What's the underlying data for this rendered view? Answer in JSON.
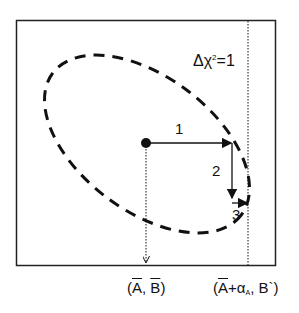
{
  "diagram": {
    "contour_label": {
      "delta": "Δ",
      "chi": "χ",
      "power": "2",
      "rest": "=1"
    },
    "steps": [
      "1",
      "2",
      "3"
    ],
    "x_labels": {
      "left": {
        "open": "(",
        "a": "A",
        "sep": ", ",
        "b": "B",
        "close": ")"
      },
      "right": {
        "open": "(",
        "a": "A",
        "plus": "+α",
        "sub": "A",
        "sep": ", B",
        "prime": "`",
        "close": ")"
      }
    },
    "colors": {
      "stroke": "#111111",
      "background": "#ffffff"
    }
  }
}
